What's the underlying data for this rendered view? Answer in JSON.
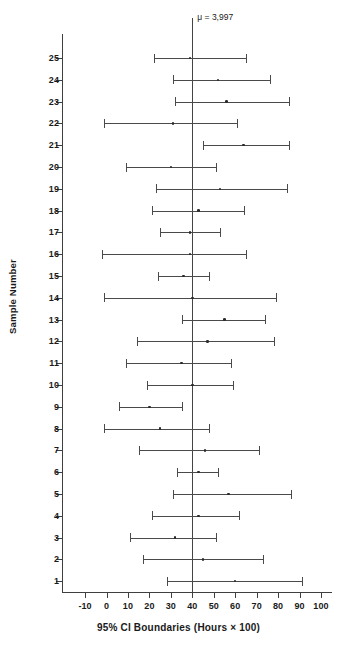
{
  "chart_data": {
    "type": "scatter",
    "title": "",
    "xlabel": "95% CI Boundaries (Hours × 100)",
    "ylabel": "Sample Number",
    "xlim": [
      -15,
      105
    ],
    "ylim": [
      0,
      26
    ],
    "grid": false,
    "legend": null,
    "xticks": [
      -10,
      0,
      10,
      20,
      30,
      40,
      50,
      60,
      70,
      80,
      90,
      100
    ],
    "xtick_labels": [
      "-10",
      "0",
      "10",
      "20",
      "30",
      "40",
      "50",
      "60",
      "70",
      "80",
      "90",
      "100"
    ],
    "yticks": [
      1,
      2,
      3,
      4,
      5,
      6,
      7,
      8,
      9,
      10,
      11,
      12,
      13,
      14,
      15,
      16,
      17,
      18,
      19,
      20,
      21,
      22,
      23,
      24,
      25
    ],
    "reference_line": {
      "label": "μ = 3,997",
      "value": 40,
      "orientation": "vertical"
    },
    "series": [
      {
        "name": "95% Confidence Intervals",
        "intervals": [
          {
            "sample": 25,
            "lower": 22,
            "upper": 65,
            "center": 39
          },
          {
            "sample": 24,
            "lower": 31,
            "upper": 76,
            "center": 52
          },
          {
            "sample": 23,
            "lower": 32,
            "upper": 85,
            "center": 56
          },
          {
            "sample": 22,
            "lower": -1,
            "upper": 61,
            "center": 31
          },
          {
            "sample": 21,
            "lower": 45,
            "upper": 85,
            "center": 64
          },
          {
            "sample": 20,
            "lower": 9,
            "upper": 51,
            "center": 30
          },
          {
            "sample": 19,
            "lower": 23,
            "upper": 84,
            "center": 53
          },
          {
            "sample": 18,
            "lower": 21,
            "upper": 64,
            "center": 43
          },
          {
            "sample": 17,
            "lower": 25,
            "upper": 53,
            "center": 39
          },
          {
            "sample": 16,
            "lower": -2,
            "upper": 65,
            "center": 39
          },
          {
            "sample": 15,
            "lower": 24,
            "upper": 48,
            "center": 36
          },
          {
            "sample": 14,
            "lower": -1,
            "upper": 79,
            "center": 40
          },
          {
            "sample": 13,
            "lower": 35,
            "upper": 74,
            "center": 55
          },
          {
            "sample": 12,
            "lower": 14,
            "upper": 78,
            "center": 47
          },
          {
            "sample": 11,
            "lower": 9,
            "upper": 58,
            "center": 35
          },
          {
            "sample": 10,
            "lower": 19,
            "upper": 59,
            "center": 40
          },
          {
            "sample": 9,
            "lower": 6,
            "upper": 35,
            "center": 20
          },
          {
            "sample": 8,
            "lower": -1,
            "upper": 48,
            "center": 25
          },
          {
            "sample": 7,
            "lower": 15,
            "upper": 71,
            "center": 46
          },
          {
            "sample": 6,
            "lower": 33,
            "upper": 52,
            "center": 43
          },
          {
            "sample": 5,
            "lower": 31,
            "upper": 86,
            "center": 57
          },
          {
            "sample": 4,
            "lower": 21,
            "upper": 62,
            "center": 43
          },
          {
            "sample": 3,
            "lower": 11,
            "upper": 51,
            "center": 32
          },
          {
            "sample": 2,
            "lower": 17,
            "upper": 73,
            "center": 45
          },
          {
            "sample": 1,
            "lower": 28,
            "upper": 91,
            "center": 60
          }
        ]
      }
    ]
  }
}
